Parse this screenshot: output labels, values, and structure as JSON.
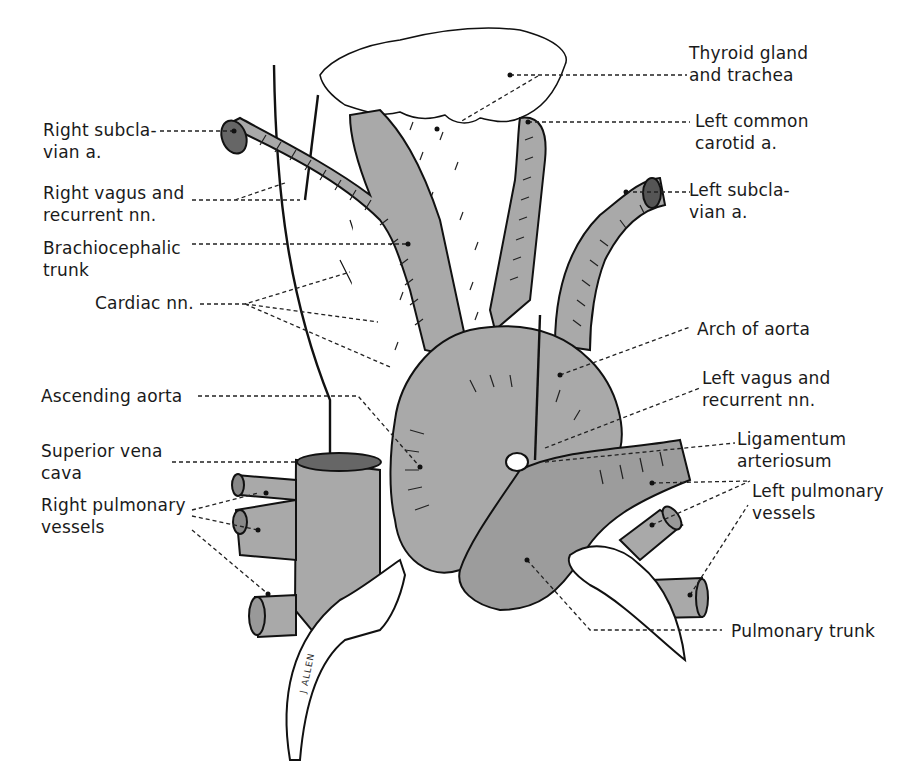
{
  "figure": {
    "colors": {
      "vessel_fill": "#a9a9a9",
      "pulmonary_fill": "#9c9c9c",
      "outline": "#111111",
      "background": "#ffffff",
      "label_text": "#1a1a1a"
    },
    "signature": "J ALLEN"
  },
  "labels": {
    "left": [
      {
        "id": "right-subclavian",
        "text": "Right subcla-\nvian a."
      },
      {
        "id": "right-vagus",
        "text": "Right vagus and\nrecurrent nn."
      },
      {
        "id": "brachiocephalic",
        "text": "Brachiocephalic\ntrunk"
      },
      {
        "id": "cardiac-nn",
        "text": "Cardiac nn."
      },
      {
        "id": "ascending-aorta",
        "text": "Ascending aorta"
      },
      {
        "id": "svc",
        "text": "Superior vena\ncava"
      },
      {
        "id": "right-pulmonary",
        "text": "Right pulmonary\nvessels"
      }
    ],
    "right": [
      {
        "id": "thyroid",
        "text": "Thyroid gland\nand trachea"
      },
      {
        "id": "left-common-carotid",
        "text": "Left common\ncarotid a."
      },
      {
        "id": "left-subclavian",
        "text": "Left subcla-\nvian a."
      },
      {
        "id": "arch-of-aorta",
        "text": "Arch of aorta"
      },
      {
        "id": "left-vagus",
        "text": "Left vagus and\nrecurrent nn."
      },
      {
        "id": "ligamentum",
        "text": "Ligamentum\narteriosum"
      },
      {
        "id": "left-pulmonary",
        "text": "Left pulmonary\nvessels"
      },
      {
        "id": "pulmonary-trunk",
        "text": "Pulmonary trunk"
      }
    ]
  }
}
